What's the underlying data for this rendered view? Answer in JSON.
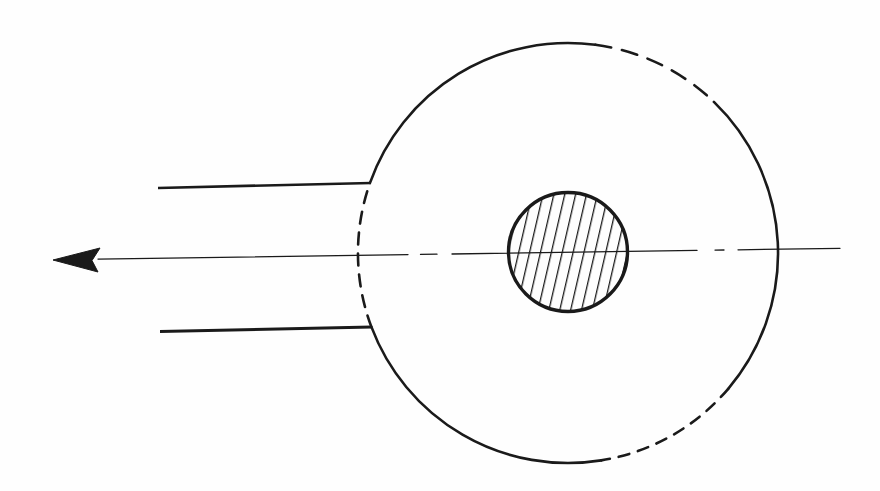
{
  "colors": {
    "paper": "#fefefe",
    "ink": "#1a1a1a"
  },
  "canvas": {
    "width": 880,
    "height": 491
  },
  "diagram": {
    "outer_circle": {
      "cx": 568,
      "cy": 253,
      "r": 210,
      "stroke_width": 2.6,
      "segments": [
        {
          "name": "outer-arc-top-left",
          "from_deg": -160.5,
          "to_deg": -82.5,
          "style": "solid"
        },
        {
          "name": "outer-arc-top-right",
          "from_deg": -82.5,
          "to_deg": -46,
          "style": "dashed",
          "dash": "16 11"
        },
        {
          "name": "outer-arc-right",
          "from_deg": -46,
          "to_deg": 40.3,
          "style": "solid"
        },
        {
          "name": "outer-arc-bottom-right",
          "from_deg": 40.3,
          "to_deg": 80.9,
          "style": "dashed",
          "dash": "11 9"
        },
        {
          "name": "outer-arc-bottom-left",
          "from_deg": 80.9,
          "to_deg": 159.4,
          "style": "solid"
        },
        {
          "name": "outer-arc-left-hidden",
          "from_deg": 159.4,
          "to_deg": 199.5,
          "style": "dashed",
          "dash": "12 9"
        }
      ]
    },
    "inner_circle": {
      "cx": 568,
      "cy": 252,
      "r": 59.5,
      "stroke_width": 3.4,
      "hatch": {
        "angle_deg": 13,
        "spacing": 10.6,
        "line_width": 2.6
      }
    },
    "axis": {
      "stroke_width": 1.3,
      "x_start": 53,
      "y_start": 259.8,
      "x_end": 840,
      "y_end": 248.3,
      "dash_segments_x": [
        [
          98,
          408
        ],
        [
          420.5,
          437
        ],
        [
          452,
          697
        ],
        [
          715,
          724
        ],
        [
          738,
          840
        ]
      ],
      "arrowhead_points": [
        [
          53,
          260
        ],
        [
          100,
          248
        ],
        [
          92,
          260.5
        ],
        [
          98,
          272
        ]
      ]
    },
    "pipe_lines": [
      {
        "name": "upper-pipe-line",
        "x1": 158,
        "y1": 188,
        "x2": 371,
        "y2": 183,
        "stroke_width": 2.7
      },
      {
        "name": "lower-pipe-line",
        "x1": 160,
        "y1": 331.5,
        "x2": 372,
        "y2": 327,
        "stroke_width": 2.9
      }
    ]
  }
}
